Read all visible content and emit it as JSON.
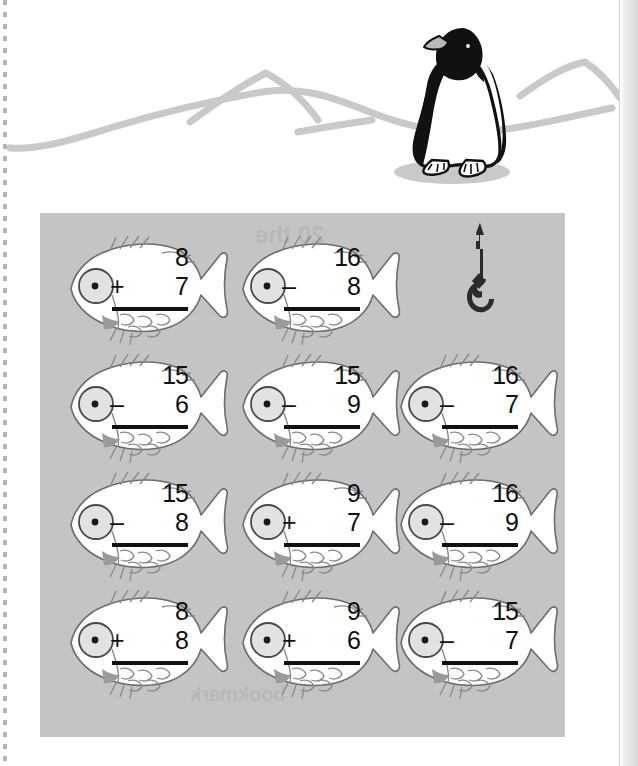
{
  "worksheet": {
    "title": "Fish Addition and Subtraction Facts Worksheet",
    "panel_color": "#c4c4c4",
    "page_color": "#ffffff",
    "ink_color": "#111111"
  },
  "scene": {
    "name": "arctic-scene",
    "penguin": {
      "name": "penguin",
      "body_color": "#1a1a1a",
      "belly_color": "#ffffff"
    },
    "hills_color": "#c9c9c9",
    "shadow_color": "#c9c9c9"
  },
  "decorations": {
    "hook": {
      "name": "fishing-hook",
      "color": "#2b2b2b"
    }
  },
  "ghost_text": {
    "line1": "20 the",
    "line2": "Set the",
    "line3": "subtraction",
    "line4": "bookmark"
  },
  "problems": [
    {
      "id": "p1",
      "row": 1,
      "col": 1,
      "top": "8",
      "operator": "+",
      "bottom": "7",
      "answer": ""
    },
    {
      "id": "p2",
      "row": 1,
      "col": 2,
      "top": "16",
      "operator": "–",
      "bottom": "8",
      "answer": ""
    },
    {
      "id": "p3",
      "row": 2,
      "col": 1,
      "top": "15",
      "operator": "–",
      "bottom": "6",
      "answer": ""
    },
    {
      "id": "p4",
      "row": 2,
      "col": 2,
      "top": "15",
      "operator": "–",
      "bottom": "9",
      "answer": ""
    },
    {
      "id": "p5",
      "row": 2,
      "col": 3,
      "top": "16",
      "operator": "–",
      "bottom": "7",
      "answer": ""
    },
    {
      "id": "p6",
      "row": 3,
      "col": 1,
      "top": "15",
      "operator": "–",
      "bottom": "8",
      "answer": ""
    },
    {
      "id": "p7",
      "row": 3,
      "col": 2,
      "top": "9",
      "operator": "+",
      "bottom": "7",
      "answer": ""
    },
    {
      "id": "p8",
      "row": 3,
      "col": 3,
      "top": "16",
      "operator": "–",
      "bottom": "9",
      "answer": ""
    },
    {
      "id": "p9",
      "row": 4,
      "col": 1,
      "top": "8",
      "operator": "+",
      "bottom": "8",
      "answer": ""
    },
    {
      "id": "p10",
      "row": 4,
      "col": 2,
      "top": "9",
      "operator": "+",
      "bottom": "6",
      "answer": ""
    },
    {
      "id": "p11",
      "row": 4,
      "col": 3,
      "top": "15",
      "operator": "–",
      "bottom": "7",
      "answer": ""
    }
  ]
}
